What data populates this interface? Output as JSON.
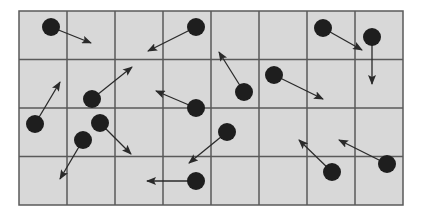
{
  "diagram": {
    "title": "",
    "grid": {
      "x0": 19,
      "y0": 11,
      "cols": 8,
      "rows": 4,
      "cell_w": 48,
      "cell_h": 48.5
    },
    "colors": {
      "background": "#d8d8d8",
      "grid_line": "#5a5a5a",
      "border": "#5a5a5a",
      "dot": "#1e1e1e",
      "arrow": "#2a2a2a"
    },
    "dot_radius": 9,
    "particles": [
      {
        "x": 51,
        "y": 27,
        "tip_x": 91,
        "tip_y": 43
      },
      {
        "x": 196,
        "y": 27,
        "tip_x": 148,
        "tip_y": 51
      },
      {
        "x": 323,
        "y": 28,
        "tip_x": 362,
        "tip_y": 50
      },
      {
        "x": 372,
        "y": 37,
        "tip_x": 372,
        "tip_y": 84
      },
      {
        "x": 92,
        "y": 99,
        "tip_x": 132,
        "tip_y": 67
      },
      {
        "x": 196,
        "y": 108,
        "tip_x": 156,
        "tip_y": 91
      },
      {
        "x": 244,
        "y": 92,
        "tip_x": 219,
        "tip_y": 52
      },
      {
        "x": 274,
        "y": 75,
        "tip_x": 323,
        "tip_y": 99
      },
      {
        "x": 35,
        "y": 124,
        "tip_x": 60,
        "tip_y": 82
      },
      {
        "x": 100,
        "y": 123,
        "tip_x": 131,
        "tip_y": 154
      },
      {
        "x": 83,
        "y": 140,
        "tip_x": 60,
        "tip_y": 179
      },
      {
        "x": 227,
        "y": 132,
        "tip_x": 189,
        "tip_y": 163
      },
      {
        "x": 196,
        "y": 181,
        "tip_x": 147,
        "tip_y": 181
      },
      {
        "x": 332,
        "y": 172,
        "tip_x": 299,
        "tip_y": 140
      },
      {
        "x": 387,
        "y": 164,
        "tip_x": 339,
        "tip_y": 140
      }
    ]
  }
}
